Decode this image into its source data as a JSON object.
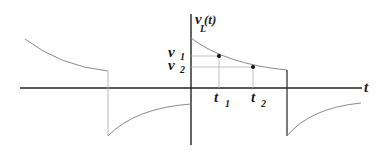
{
  "diagram": {
    "colors": {
      "axis": "#222222",
      "curve": "#8a8a8a",
      "guide": "#b0b0b0",
      "point": "#111111"
    },
    "y_axis": {
      "label_main": "v",
      "label_sub": "L",
      "label_rest": "(t)"
    },
    "x_axis": {
      "label": "t"
    },
    "levels": [
      {
        "main": "v",
        "sub": "1"
      },
      {
        "main": "v",
        "sub": "2"
      }
    ],
    "times": [
      {
        "main": "t",
        "sub": "1"
      },
      {
        "main": "t",
        "sub": "2"
      }
    ]
  }
}
